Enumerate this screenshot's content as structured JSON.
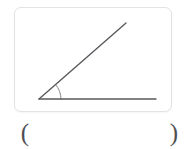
{
  "page": {
    "background_color": "#ffffff",
    "width": 188,
    "height": 149
  },
  "figure_card": {
    "name": "angle-figure-card",
    "background_color": "#ffffff",
    "border_color": "#e3e3e5",
    "border_radius_px": 7
  },
  "figure": {
    "type": "angle-diagram",
    "stroke_color": "#59595e",
    "arc_color": "#8a8a90",
    "stroke_width": 1.4,
    "vertex": {
      "x": 24,
      "y": 91
    },
    "rays": [
      {
        "name": "horizontal-ray",
        "from": {
          "x": 24,
          "y": 91
        },
        "to": {
          "x": 141,
          "y": 91
        }
      },
      {
        "name": "diagonal-ray",
        "from": {
          "x": 24,
          "y": 91
        },
        "to": {
          "x": 111,
          "y": 15
        }
      }
    ],
    "angle_arc": {
      "name": "angle-arc",
      "radius_px": 22,
      "measure_degrees": 41
    }
  },
  "answer_slot": {
    "open_paren": "(",
    "close_paren": ")",
    "value": "",
    "placeholder": ""
  }
}
